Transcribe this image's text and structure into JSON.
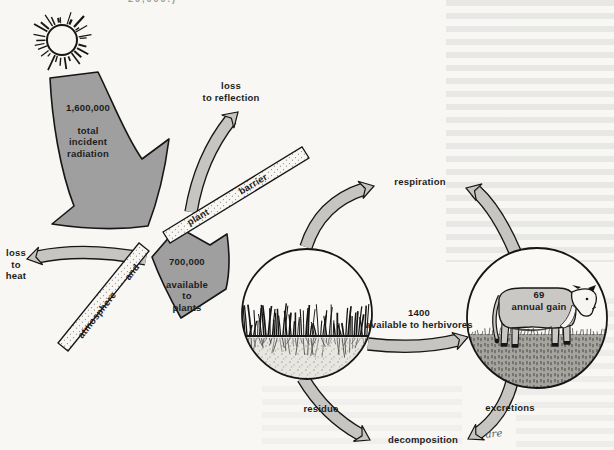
{
  "page": {
    "cropped_caption": "20,000.)"
  },
  "flows": {
    "incident": {
      "value": "1,600,000",
      "label": "total\nincident\nradiation"
    },
    "reflection": "loss\nto reflection",
    "heat": "loss\nto\nheat",
    "available_plants": {
      "value": "700,000",
      "label": "available\nto\nplants"
    },
    "respiration": "respiration",
    "herbivores": {
      "value": "1400",
      "label": "available to herbivores"
    },
    "annual_gain": {
      "value": "69",
      "label": "annual gain"
    },
    "residue": "residue",
    "excretions": "excretions",
    "decomposition": "decomposition",
    "handwritten_note": "are"
  },
  "barriers": {
    "plant": "plant",
    "barrier": "barrier",
    "atmosphere": "atmosphere",
    "and": "and"
  },
  "colors": {
    "paper": "#f8f7f4",
    "big_arrow_gray": "#9f9f9f",
    "band_arrow_gray": "#c6c5c1",
    "ink": "#161616",
    "cow_body_gray": "#c9c8c4",
    "cow_face_white": "#f6f5f2",
    "soil_light": "#e8e6e1",
    "turf_gray": "#a5a49f"
  }
}
